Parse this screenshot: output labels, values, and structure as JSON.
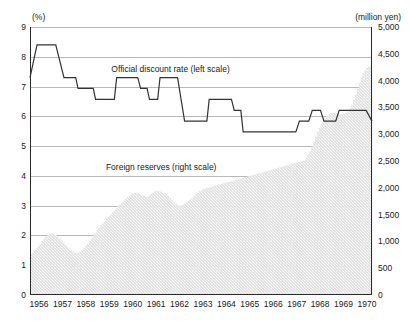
{
  "chart_data": {
    "type": "line",
    "title": "",
    "subtitle": "",
    "xlabel": "",
    "ylabel_left": "(%)",
    "ylabel_right": "(million yen)",
    "grid": true,
    "legend_position": "inline-annotation",
    "x": [
      1956,
      1957,
      1958,
      1959,
      1960,
      1961,
      1962,
      1963,
      1964,
      1965,
      1966,
      1967,
      1968,
      1969,
      1970
    ],
    "xtick_labels": [
      "1956",
      "1957",
      "1958",
      "1959",
      "1960",
      "1961",
      "1962",
      "1963",
      "1964",
      "1965",
      "1966",
      "1967",
      "1968",
      "1969",
      "1970"
    ],
    "xlim": [
      1956,
      1970.6
    ],
    "left_axis": {
      "label": "(%)",
      "ylim": [
        0,
        9
      ],
      "ticks": [
        0,
        1,
        2,
        3,
        4,
        5,
        6,
        7,
        8,
        9
      ],
      "tick_labels": [
        "0",
        "1",
        "2",
        "3",
        "4",
        "5",
        "6",
        "7",
        "8",
        "9"
      ]
    },
    "right_axis": {
      "label": "(million yen)",
      "ylim": [
        0,
        5000
      ],
      "ticks": [
        0,
        500,
        1000,
        1500,
        2000,
        2500,
        3000,
        3500,
        4000,
        4500,
        5000
      ],
      "tick_labels": [
        "0",
        "500",
        "1,000",
        "1,500",
        "2,000",
        "2,500",
        "3,000",
        "3,500",
        "4,000",
        "4,500",
        "5,000"
      ]
    },
    "series": [
      {
        "name": "Official discount rate (left scale)",
        "type": "step-line",
        "axis": "left",
        "units": "%",
        "color": "#333333",
        "annotation": "Official discount rate (left scale)",
        "annotation_x": 1962.0,
        "annotation_y": 7.55,
        "points": [
          {
            "x": 1956.0,
            "y": 7.3
          },
          {
            "x": 1956.3,
            "y": 8.4
          },
          {
            "x": 1957.1,
            "y": 8.4
          },
          {
            "x": 1957.45,
            "y": 7.3
          },
          {
            "x": 1957.95,
            "y": 7.3
          },
          {
            "x": 1958.05,
            "y": 6.94
          },
          {
            "x": 1958.7,
            "y": 6.94
          },
          {
            "x": 1958.8,
            "y": 6.57
          },
          {
            "x": 1959.6,
            "y": 6.57
          },
          {
            "x": 1959.7,
            "y": 7.3
          },
          {
            "x": 1960.6,
            "y": 7.3
          },
          {
            "x": 1960.72,
            "y": 6.94
          },
          {
            "x": 1961.0,
            "y": 6.94
          },
          {
            "x": 1961.1,
            "y": 6.57
          },
          {
            "x": 1961.45,
            "y": 6.57
          },
          {
            "x": 1961.55,
            "y": 7.3
          },
          {
            "x": 1962.3,
            "y": 7.3
          },
          {
            "x": 1962.45,
            "y": 6.57
          },
          {
            "x": 1962.6,
            "y": 5.84
          },
          {
            "x": 1963.55,
            "y": 5.84
          },
          {
            "x": 1963.65,
            "y": 6.57
          },
          {
            "x": 1964.6,
            "y": 6.57
          },
          {
            "x": 1964.72,
            "y": 6.2
          },
          {
            "x": 1965.0,
            "y": 6.2
          },
          {
            "x": 1965.1,
            "y": 5.48
          },
          {
            "x": 1967.35,
            "y": 5.48
          },
          {
            "x": 1967.5,
            "y": 5.84
          },
          {
            "x": 1967.9,
            "y": 5.84
          },
          {
            "x": 1968.05,
            "y": 6.2
          },
          {
            "x": 1968.4,
            "y": 6.2
          },
          {
            "x": 1968.55,
            "y": 5.84
          },
          {
            "x": 1969.05,
            "y": 5.84
          },
          {
            "x": 1969.2,
            "y": 6.2
          },
          {
            "x": 1970.0,
            "y": 6.2
          },
          {
            "x": 1970.35,
            "y": 6.2
          },
          {
            "x": 1970.6,
            "y": 5.84
          }
        ]
      },
      {
        "name": "Foreign reserves (right scale)",
        "type": "area-bars",
        "axis": "right",
        "units": "million yen",
        "color": "#d9d9d9",
        "annotation": "Foreign reserves (right scale)",
        "annotation_x": 1961.6,
        "annotation_y": 4.27,
        "monthly_values": [
          760,
          790,
          830,
          870,
          910,
          960,
          1010,
          1060,
          1090,
          1120,
          1140,
          1150,
          1140,
          1120,
          1090,
          1060,
          1020,
          980,
          940,
          900,
          870,
          840,
          810,
          790,
          780,
          790,
          810,
          840,
          880,
          920,
          960,
          1010,
          1060,
          1110,
          1160,
          1210,
          1250,
          1300,
          1340,
          1380,
          1420,
          1460,
          1500,
          1540,
          1580,
          1620,
          1660,
          1700,
          1730,
          1760,
          1790,
          1820,
          1850,
          1880,
          1900,
          1910,
          1900,
          1890,
          1870,
          1850,
          1830,
          1830,
          1850,
          1880,
          1910,
          1930,
          1940,
          1940,
          1930,
          1920,
          1900,
          1880,
          1850,
          1810,
          1770,
          1730,
          1700,
          1680,
          1670,
          1670,
          1680,
          1700,
          1730,
          1760,
          1790,
          1820,
          1850,
          1880,
          1910,
          1940,
          1960,
          1980,
          1990,
          2000,
          2010,
          2020,
          2030,
          2040,
          2050,
          2060,
          2070,
          2080,
          2090,
          2100,
          2110,
          2120,
          2130,
          2140,
          2150,
          2160,
          2170,
          2180,
          2190,
          2200,
          2210,
          2220,
          2230,
          2240,
          2250,
          2260,
          2270,
          2280,
          2290,
          2300,
          2310,
          2320,
          2330,
          2340,
          2350,
          2360,
          2370,
          2380,
          2390,
          2400,
          2410,
          2420,
          2430,
          2440,
          2450,
          2460,
          2470,
          2480,
          2490,
          2500,
          2520,
          2560,
          2620,
          2690,
          2770,
          2860,
          2950,
          3040,
          3120,
          3190,
          3250,
          3300,
          3340,
          3370,
          3390,
          3400,
          3400,
          3390,
          3380,
          3370,
          3370,
          3380,
          3400,
          3430,
          3480,
          3550,
          3640,
          3740,
          3850,
          3960,
          4060,
          4140,
          4200,
          4240,
          4260,
          4270
        ],
        "annual_summary": [
          {
            "year": 1956,
            "value": 1000
          },
          {
            "year": 1957,
            "value": 940
          },
          {
            "year": 1958,
            "value": 980
          },
          {
            "year": 1959,
            "value": 1470
          },
          {
            "year": 1960,
            "value": 1850
          },
          {
            "year": 1961,
            "value": 1890
          },
          {
            "year": 1962,
            "value": 1760
          },
          {
            "year": 1963,
            "value": 1890
          },
          {
            "year": 1964,
            "value": 2060
          },
          {
            "year": 1965,
            "value": 2190
          },
          {
            "year": 1966,
            "value": 2330
          },
          {
            "year": 1967,
            "value": 2450
          },
          {
            "year": 1968,
            "value": 2960
          },
          {
            "year": 1969,
            "value": 3390
          },
          {
            "year": 1970,
            "value": 3950
          }
        ]
      }
    ]
  }
}
